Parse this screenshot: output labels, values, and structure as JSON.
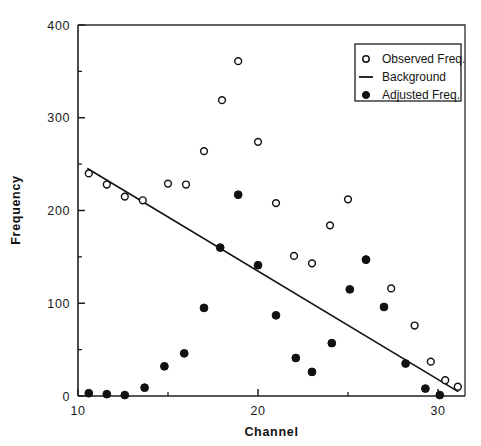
{
  "chart_data": {
    "type": "scatter",
    "title": "",
    "xlabel": "Channel",
    "ylabel": "Frequency",
    "xlim": [
      10,
      31.5
    ],
    "ylim": [
      0,
      400
    ],
    "xticks": [
      10,
      20,
      30
    ],
    "xtick_labels": [
      "10",
      "20",
      "30"
    ],
    "xticks_minor": [
      15,
      25
    ],
    "yticks": [
      0,
      100,
      200,
      300,
      400
    ],
    "ytick_labels": [
      "0",
      "100",
      "200",
      "300",
      "400"
    ],
    "yticks_minor": [
      50,
      150,
      250,
      350
    ],
    "grid": false,
    "legend_position": "upper right",
    "series": [
      {
        "name": "Observed Freq.",
        "marker": "open-circle",
        "color": "#111111",
        "points": [
          {
            "x": 10.6,
            "y": 240
          },
          {
            "x": 11.6,
            "y": 228
          },
          {
            "x": 12.6,
            "y": 215
          },
          {
            "x": 13.6,
            "y": 211
          },
          {
            "x": 15.0,
            "y": 229
          },
          {
            "x": 16.0,
            "y": 228
          },
          {
            "x": 17.0,
            "y": 264
          },
          {
            "x": 18.0,
            "y": 319
          },
          {
            "x": 18.9,
            "y": 361
          },
          {
            "x": 20.0,
            "y": 274
          },
          {
            "x": 21.0,
            "y": 208
          },
          {
            "x": 22.0,
            "y": 151
          },
          {
            "x": 23.0,
            "y": 143
          },
          {
            "x": 24.0,
            "y": 184
          },
          {
            "x": 25.0,
            "y": 212
          },
          {
            "x": 26.0,
            "y": 147
          },
          {
            "x": 27.4,
            "y": 116
          },
          {
            "x": 28.7,
            "y": 76
          },
          {
            "x": 29.6,
            "y": 37
          },
          {
            "x": 30.4,
            "y": 17
          },
          {
            "x": 31.1,
            "y": 10
          }
        ]
      },
      {
        "name": "Adjusted Freq.",
        "marker": "filled-circle",
        "color": "#111111",
        "points": [
          {
            "x": 10.6,
            "y": 3
          },
          {
            "x": 11.6,
            "y": 2
          },
          {
            "x": 12.6,
            "y": 1
          },
          {
            "x": 13.7,
            "y": 9
          },
          {
            "x": 14.8,
            "y": 32
          },
          {
            "x": 15.9,
            "y": 46
          },
          {
            "x": 17.0,
            "y": 95
          },
          {
            "x": 17.9,
            "y": 160
          },
          {
            "x": 18.9,
            "y": 217
          },
          {
            "x": 20.0,
            "y": 141
          },
          {
            "x": 21.0,
            "y": 87
          },
          {
            "x": 22.1,
            "y": 41
          },
          {
            "x": 23.0,
            "y": 26
          },
          {
            "x": 24.1,
            "y": 57
          },
          {
            "x": 25.1,
            "y": 115
          },
          {
            "x": 26.0,
            "y": 147
          },
          {
            "x": 27.0,
            "y": 96
          },
          {
            "x": 28.2,
            "y": 35
          },
          {
            "x": 29.3,
            "y": 8
          },
          {
            "x": 30.1,
            "y": 1
          }
        ]
      },
      {
        "name": "Background",
        "marker": "line",
        "color": "#141414",
        "points": [
          {
            "x": 10.55,
            "y": 245
          },
          {
            "x": 31.1,
            "y": 5
          }
        ]
      }
    ],
    "legend": [
      {
        "label": "Observed Freq.",
        "marker": "open-circle"
      },
      {
        "label": "Background",
        "marker": "line"
      },
      {
        "label": "Adjusted Freq.",
        "marker": "filled-circle"
      }
    ]
  }
}
